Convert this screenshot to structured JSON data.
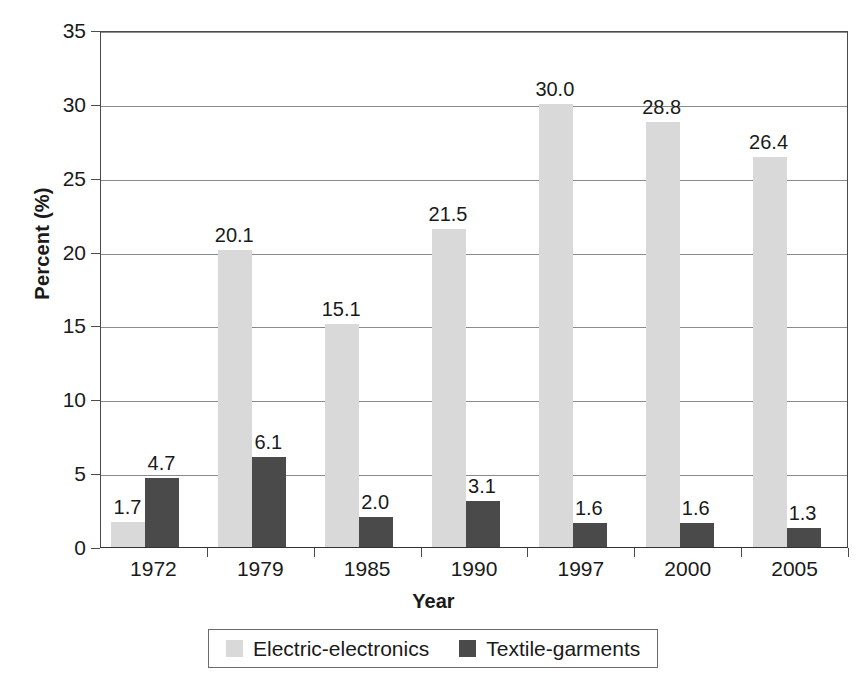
{
  "chart_data": {
    "type": "bar",
    "title": "",
    "subtitle": "",
    "xlabel": "Year",
    "ylabel": "Percent (%)",
    "categories": [
      "1972",
      "1979",
      "1985",
      "1990",
      "1997",
      "2000",
      "2005"
    ],
    "series": [
      {
        "name": "Electric-electronics",
        "color": "#d9d9d9",
        "values": [
          1.7,
          20.1,
          15.1,
          21.5,
          30.0,
          28.8,
          26.4
        ],
        "labels": [
          "1.7",
          "20.1",
          "15.1",
          "21.5",
          "30.0",
          "28.8",
          "26.4"
        ]
      },
      {
        "name": "Textile-garments",
        "color": "#4a4a4a",
        "values": [
          4.7,
          6.1,
          2.0,
          3.1,
          1.6,
          1.6,
          1.3
        ],
        "labels": [
          "4.7",
          "6.1",
          "2.0",
          "3.1",
          "1.6",
          "1.6",
          "1.3"
        ]
      }
    ],
    "ylim": [
      0,
      35
    ],
    "yticks": [
      0,
      5,
      10,
      15,
      20,
      25,
      30,
      35
    ],
    "ytick_labels": [
      "0",
      "5",
      "10",
      "15",
      "20",
      "25",
      "30",
      "35"
    ],
    "grid": "horizontal",
    "legend_position": "bottom",
    "value_labels": true
  }
}
